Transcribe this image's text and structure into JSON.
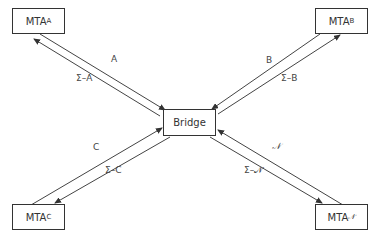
{
  "diagram": {
    "nodes": {
      "mta_a": {
        "label": "MTA",
        "sub": "A"
      },
      "mta_b": {
        "label": "MTA",
        "sub": "B"
      },
      "mta_c": {
        "label": "MTA",
        "sub": "C"
      },
      "mta_n": {
        "label": "MTA",
        "sub": "𝒩"
      },
      "bridge": {
        "label": "Bridge"
      }
    },
    "edges": {
      "a_to_bridge": {
        "label": "A"
      },
      "bridge_to_a": {
        "label": "Σ–A"
      },
      "b_to_bridge": {
        "label": "B"
      },
      "bridge_to_b": {
        "label": "Σ–B"
      },
      "c_to_bridge": {
        "label": "C"
      },
      "bridge_to_c": {
        "label": "Σ–C"
      },
      "n_to_bridge": {
        "label": "𝒩"
      },
      "bridge_to_n": {
        "label": "Σ–𝒩"
      }
    },
    "line_color": "#333333"
  }
}
